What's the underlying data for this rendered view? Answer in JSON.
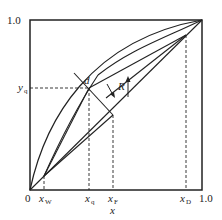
{
  "diagram": {
    "axes": {
      "x_label": "x",
      "y_top_label": "1.0",
      "x_right_label": "1.0",
      "origin_label": "0"
    },
    "x_ticks": [
      {
        "label": "x",
        "sub": "W",
        "x": 44
      },
      {
        "label": "x",
        "sub": "q",
        "x": 89
      },
      {
        "label": "x",
        "sub": "F",
        "x": 113
      },
      {
        "label": "x",
        "sub": "D",
        "x": 186
      }
    ],
    "y_ticks": [
      {
        "label": "y",
        "sub": "q",
        "y": 88
      }
    ],
    "annotations": {
      "point_d": "d",
      "reflux": "R"
    },
    "colors": {
      "line": "#222222",
      "background": "#ffffff"
    }
  }
}
